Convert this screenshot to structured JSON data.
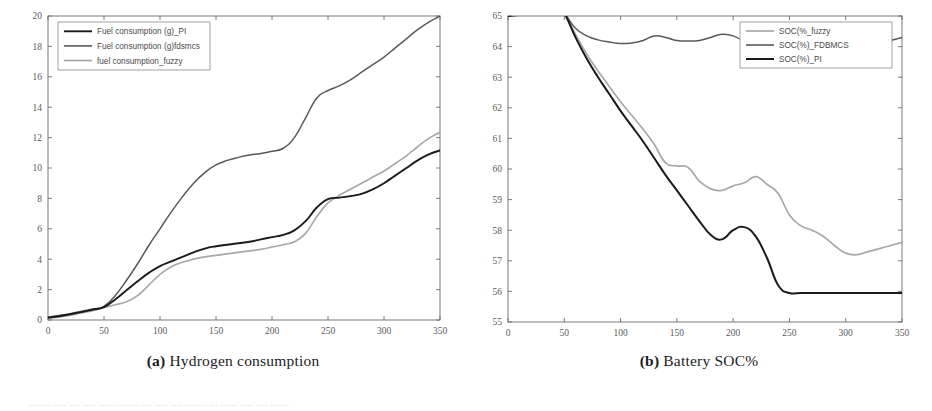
{
  "figure": {
    "panels": [
      {
        "id": "a",
        "caption_label": "(a)",
        "caption_text": "Hydrogen consumption"
      },
      {
        "id": "b",
        "caption_label": "(b)",
        "caption_text": "Battery SOC%"
      }
    ],
    "footer_text": "........ ..... .... ..... ..... ........ .... ..... .... ........ ... ...... ..... .... ......."
  },
  "colors": {
    "dark": "#1a1a1a",
    "mid": "#595959",
    "light": "#a8a8a8",
    "axis": "#6b6b6b",
    "legend_border": "#8a8a8a",
    "background": "#ffffff"
  },
  "chart_data": [
    {
      "type": "line",
      "panel": "a",
      "title": "Hydrogen consumption",
      "xlabel": "",
      "ylabel": "",
      "xlim": [
        0,
        350
      ],
      "ylim": [
        0,
        20
      ],
      "xticks": [
        0,
        50,
        100,
        150,
        200,
        250,
        300,
        350
      ],
      "xticklabels": [
        "0",
        "50",
        "100",
        "150",
        "200",
        "250",
        "300",
        "350"
      ],
      "yticks": [
        0,
        2,
        4,
        6,
        8,
        10,
        12,
        14,
        16,
        18,
        20
      ],
      "yticklabels": [
        "0",
        "2",
        "4",
        "6",
        "8",
        "10",
        "12",
        "14",
        "16",
        "18",
        "20"
      ],
      "grid": false,
      "legend_position": "upper-left",
      "series": [
        {
          "name": "Fuel consumption (g)_PI",
          "color": "#1a1a1a",
          "width": 1.9,
          "x": [
            0,
            10,
            20,
            30,
            40,
            50,
            60,
            70,
            80,
            90,
            100,
            110,
            120,
            130,
            140,
            150,
            160,
            170,
            180,
            190,
            200,
            210,
            220,
            230,
            240,
            250,
            260,
            270,
            280,
            290,
            300,
            310,
            320,
            330,
            340,
            350
          ],
          "y": [
            0.15,
            0.25,
            0.38,
            0.52,
            0.68,
            0.85,
            1.35,
            1.95,
            2.55,
            3.1,
            3.55,
            3.85,
            4.15,
            4.45,
            4.7,
            4.85,
            4.95,
            5.05,
            5.15,
            5.3,
            5.45,
            5.6,
            5.9,
            6.5,
            7.4,
            7.95,
            8.05,
            8.15,
            8.3,
            8.6,
            9.0,
            9.5,
            10.0,
            10.5,
            10.9,
            11.15
          ]
        },
        {
          "name": "Fuel consumption (g)fdsmcs",
          "color": "#595959",
          "width": 1.5,
          "x": [
            0,
            10,
            20,
            30,
            40,
            50,
            60,
            70,
            80,
            90,
            100,
            110,
            120,
            130,
            140,
            150,
            160,
            170,
            180,
            190,
            200,
            210,
            220,
            230,
            240,
            250,
            260,
            270,
            280,
            290,
            300,
            310,
            320,
            330,
            340,
            350
          ],
          "y": [
            0.2,
            0.3,
            0.42,
            0.58,
            0.72,
            0.9,
            1.6,
            2.6,
            3.7,
            4.9,
            6.0,
            7.1,
            8.1,
            9.0,
            9.7,
            10.2,
            10.5,
            10.7,
            10.85,
            10.95,
            11.1,
            11.3,
            12.0,
            13.3,
            14.6,
            15.1,
            15.4,
            15.8,
            16.3,
            16.8,
            17.3,
            17.9,
            18.5,
            19.1,
            19.6,
            20.0
          ]
        },
        {
          "name": "fuel consumption_fuzzy",
          "color": "#a8a8a8",
          "width": 1.7,
          "x": [
            0,
            10,
            20,
            30,
            40,
            50,
            60,
            70,
            80,
            90,
            100,
            110,
            120,
            130,
            140,
            150,
            160,
            170,
            180,
            190,
            200,
            210,
            220,
            230,
            240,
            250,
            260,
            270,
            280,
            290,
            300,
            310,
            320,
            330,
            340,
            350
          ],
          "y": [
            0.1,
            0.2,
            0.32,
            0.48,
            0.62,
            0.82,
            1.0,
            1.2,
            1.6,
            2.3,
            3.0,
            3.5,
            3.8,
            4.0,
            4.15,
            4.25,
            4.35,
            4.45,
            4.55,
            4.65,
            4.8,
            4.95,
            5.15,
            5.7,
            6.8,
            7.7,
            8.2,
            8.6,
            9.0,
            9.4,
            9.8,
            10.3,
            10.8,
            11.4,
            11.95,
            12.35
          ]
        }
      ]
    },
    {
      "type": "line",
      "panel": "b",
      "title": "Battery SOC%",
      "xlabel": "",
      "ylabel": "",
      "xlim": [
        0,
        350
      ],
      "ylim": [
        55,
        65
      ],
      "xticks": [
        0,
        50,
        100,
        150,
        200,
        250,
        300,
        350
      ],
      "xticklabels": [
        "0",
        "50",
        "100",
        "150",
        "200",
        "250",
        "300",
        "350"
      ],
      "yticks": [
        55,
        56,
        57,
        58,
        59,
        60,
        61,
        62,
        63,
        64,
        65
      ],
      "yticklabels": [
        "55",
        "56",
        "57",
        "58",
        "59",
        "60",
        "61",
        "62",
        "63",
        "64",
        "65"
      ],
      "grid": false,
      "legend_position": "upper-right",
      "series": [
        {
          "name": "SOC(%_fuzzy",
          "color": "#a8a8a8",
          "width": 1.7,
          "x": [
            0,
            10,
            20,
            30,
            40,
            45,
            50,
            60,
            70,
            80,
            90,
            100,
            110,
            120,
            130,
            140,
            150,
            160,
            170,
            180,
            190,
            200,
            210,
            220,
            230,
            240,
            250,
            260,
            270,
            280,
            290,
            300,
            310,
            320,
            330,
            340,
            350
          ],
          "y": [
            65.0,
            65.05,
            65.1,
            65.18,
            65.25,
            65.3,
            65.1,
            64.4,
            63.75,
            63.2,
            62.7,
            62.2,
            61.75,
            61.3,
            60.8,
            60.2,
            60.1,
            60.05,
            59.6,
            59.35,
            59.3,
            59.45,
            59.55,
            59.75,
            59.5,
            59.2,
            58.5,
            58.15,
            58.0,
            57.8,
            57.5,
            57.25,
            57.2,
            57.3,
            57.4,
            57.5,
            57.6
          ]
        },
        {
          "name": "SOC(%)_FDBMCS",
          "color": "#595959",
          "width": 1.5,
          "x": [
            0,
            10,
            20,
            30,
            40,
            45,
            50,
            60,
            70,
            80,
            90,
            100,
            110,
            120,
            130,
            140,
            150,
            160,
            170,
            180,
            190,
            200,
            210,
            220,
            230,
            240,
            250,
            260,
            270,
            280,
            290,
            300,
            310,
            320,
            330,
            340,
            350
          ],
          "y": [
            65.0,
            65.05,
            65.1,
            65.15,
            65.22,
            65.25,
            65.1,
            64.6,
            64.35,
            64.22,
            64.15,
            64.1,
            64.12,
            64.2,
            64.35,
            64.3,
            64.2,
            64.18,
            64.2,
            64.3,
            64.4,
            64.35,
            64.15,
            63.85,
            63.6,
            63.65,
            63.8,
            63.9,
            63.95,
            64.0,
            64.0,
            64.0,
            64.0,
            64.05,
            64.1,
            64.2,
            64.3
          ]
        },
        {
          "name": "SOC(%)_PI",
          "color": "#1a1a1a",
          "width": 2.0,
          "x": [
            0,
            10,
            20,
            30,
            40,
            45,
            50,
            60,
            70,
            80,
            90,
            100,
            110,
            120,
            130,
            140,
            150,
            160,
            170,
            180,
            190,
            200,
            210,
            220,
            230,
            240,
            250,
            260,
            270,
            280,
            290,
            300,
            310,
            320,
            330,
            340,
            350
          ],
          "y": [
            65.0,
            65.03,
            65.07,
            65.12,
            65.18,
            65.2,
            65.1,
            64.3,
            63.6,
            63.0,
            62.45,
            61.9,
            61.4,
            60.9,
            60.35,
            59.8,
            59.3,
            58.8,
            58.3,
            57.85,
            57.7,
            58.0,
            58.1,
            57.8,
            57.1,
            56.2,
            55.95,
            55.95,
            55.95,
            55.95,
            55.95,
            55.95,
            55.95,
            55.95,
            55.95,
            55.95,
            55.95
          ]
        }
      ]
    }
  ]
}
